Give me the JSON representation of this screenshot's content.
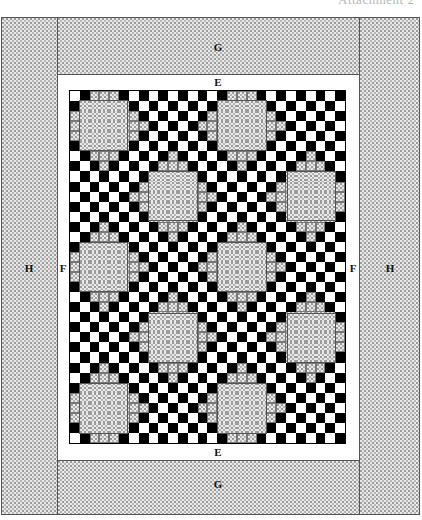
{
  "header": {
    "text": "Attachment 2"
  },
  "labels": {
    "g_top": "G",
    "g_bottom": "G",
    "e_top": "E",
    "e_bottom": "E",
    "f_left": "F",
    "f_right": "F",
    "h_left": "H",
    "h_right": "H"
  },
  "quilt": {
    "grid_columns": 28,
    "grid_rows": 35,
    "block_size_cells": 5,
    "block_period_cells": 7,
    "block_rows_start": [
      1,
      8,
      15,
      22,
      29
    ],
    "blocks": [
      {
        "row": 1,
        "col": 1
      },
      {
        "row": 1,
        "col": 15
      },
      {
        "row": 8,
        "col": 8
      },
      {
        "row": 8,
        "col": 22
      },
      {
        "row": 15,
        "col": 1
      },
      {
        "row": 15,
        "col": 15
      },
      {
        "row": 22,
        "col": 8
      },
      {
        "row": 22,
        "col": 22
      },
      {
        "row": 29,
        "col": 1
      },
      {
        "row": 29,
        "col": 15
      }
    ],
    "colors": {
      "dark": "#000000",
      "light": "#ffffff",
      "texture": "#e9e9e9",
      "outline": "#555555"
    }
  }
}
